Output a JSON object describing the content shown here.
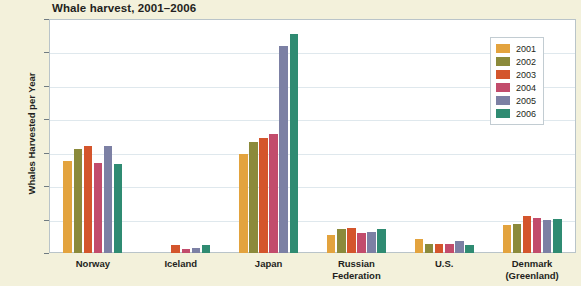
{
  "chart_data": {
    "type": "bar",
    "title": "Whale harvest, 2001–2006",
    "xlabel": "",
    "ylabel": "Whales Harvested  per Year",
    "ylim": [
      0,
      1400
    ],
    "ytick_step": 200,
    "yticks": [
      "0",
      "200",
      "400",
      "600",
      "800",
      "1000",
      "1200",
      "1400"
    ],
    "grid": true,
    "legend_position": "top-right",
    "categories": [
      "Norway",
      "Iceland",
      "Japan",
      "Russian Federation",
      "U.S.",
      "Denmark (Greenland)"
    ],
    "category_lines": [
      [
        "Norway"
      ],
      [
        "Iceland"
      ],
      [
        "Japan"
      ],
      [
        "Russian",
        "Federation"
      ],
      [
        "U.S."
      ],
      [
        "Denmark",
        "(Greenland)"
      ]
    ],
    "series": [
      {
        "name": "2001",
        "color": "#e3a33e",
        "values": [
          550,
          0,
          595,
          110,
          85,
          170
        ]
      },
      {
        "name": "2002",
        "color": "#8b8a3b",
        "values": [
          625,
          0,
          665,
          145,
          55,
          175
        ]
      },
      {
        "name": "2003",
        "color": "#d4552c",
        "values": [
          640,
          45,
          690,
          150,
          55,
          220
        ]
      },
      {
        "name": "2004",
        "color": "#c24c6c",
        "values": [
          540,
          25,
          715,
          120,
          55,
          210
        ]
      },
      {
        "name": "2005",
        "color": "#7c80a4",
        "values": [
          640,
          30,
          1240,
          125,
          70,
          200
        ]
      },
      {
        "name": "2006",
        "color": "#2f8b72",
        "values": [
          535,
          45,
          1310,
          145,
          45,
          205
        ]
      }
    ]
  }
}
